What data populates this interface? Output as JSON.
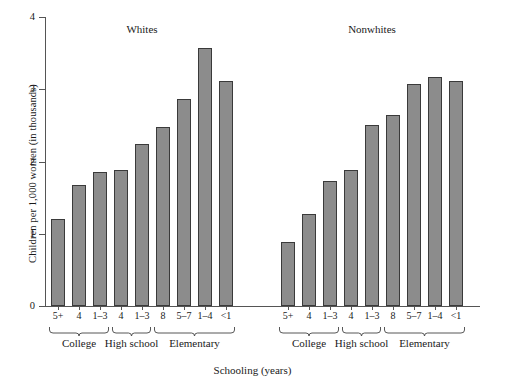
{
  "chart_data": {
    "type": "bar",
    "title": "",
    "xlabel": "Schooling (years)",
    "ylabel": "Children per 1,000 women (in thousands)",
    "ylim": [
      0,
      4
    ],
    "yticks": [
      0,
      1,
      2,
      3,
      4
    ],
    "ytick_labels": [
      "0",
      "1",
      "2",
      "3",
      "4"
    ],
    "grid": false,
    "legend": "none",
    "bar_color": "#8c8c8c",
    "bar_edge_color": "#3a3a3a",
    "panels": [
      {
        "name": "Whites",
        "categories": [
          "5+",
          "4",
          "1–3",
          "4",
          "1–3",
          "8",
          "5–7",
          "1–4",
          "<1"
        ],
        "values": [
          1.2,
          1.68,
          1.85,
          1.88,
          2.24,
          2.48,
          2.87,
          3.57,
          3.11
        ],
        "brackets": [
          {
            "label": "College",
            "from": 0,
            "to": 2
          },
          {
            "label": "High school",
            "from": 3,
            "to": 4
          },
          {
            "label": "Elementary",
            "from": 5,
            "to": 8
          }
        ]
      },
      {
        "name": "Nonwhites",
        "categories": [
          "5+",
          "4",
          "1–3",
          "4",
          "1–3",
          "8",
          "5–7",
          "1–4",
          "<1"
        ],
        "values": [
          0.89,
          1.27,
          1.73,
          1.88,
          2.5,
          2.65,
          3.07,
          3.17,
          3.12
        ],
        "brackets": [
          {
            "label": "College",
            "from": 0,
            "to": 2
          },
          {
            "label": "High school",
            "from": 3,
            "to": 4
          },
          {
            "label": "Elementary",
            "from": 5,
            "to": 8
          }
        ]
      }
    ]
  }
}
